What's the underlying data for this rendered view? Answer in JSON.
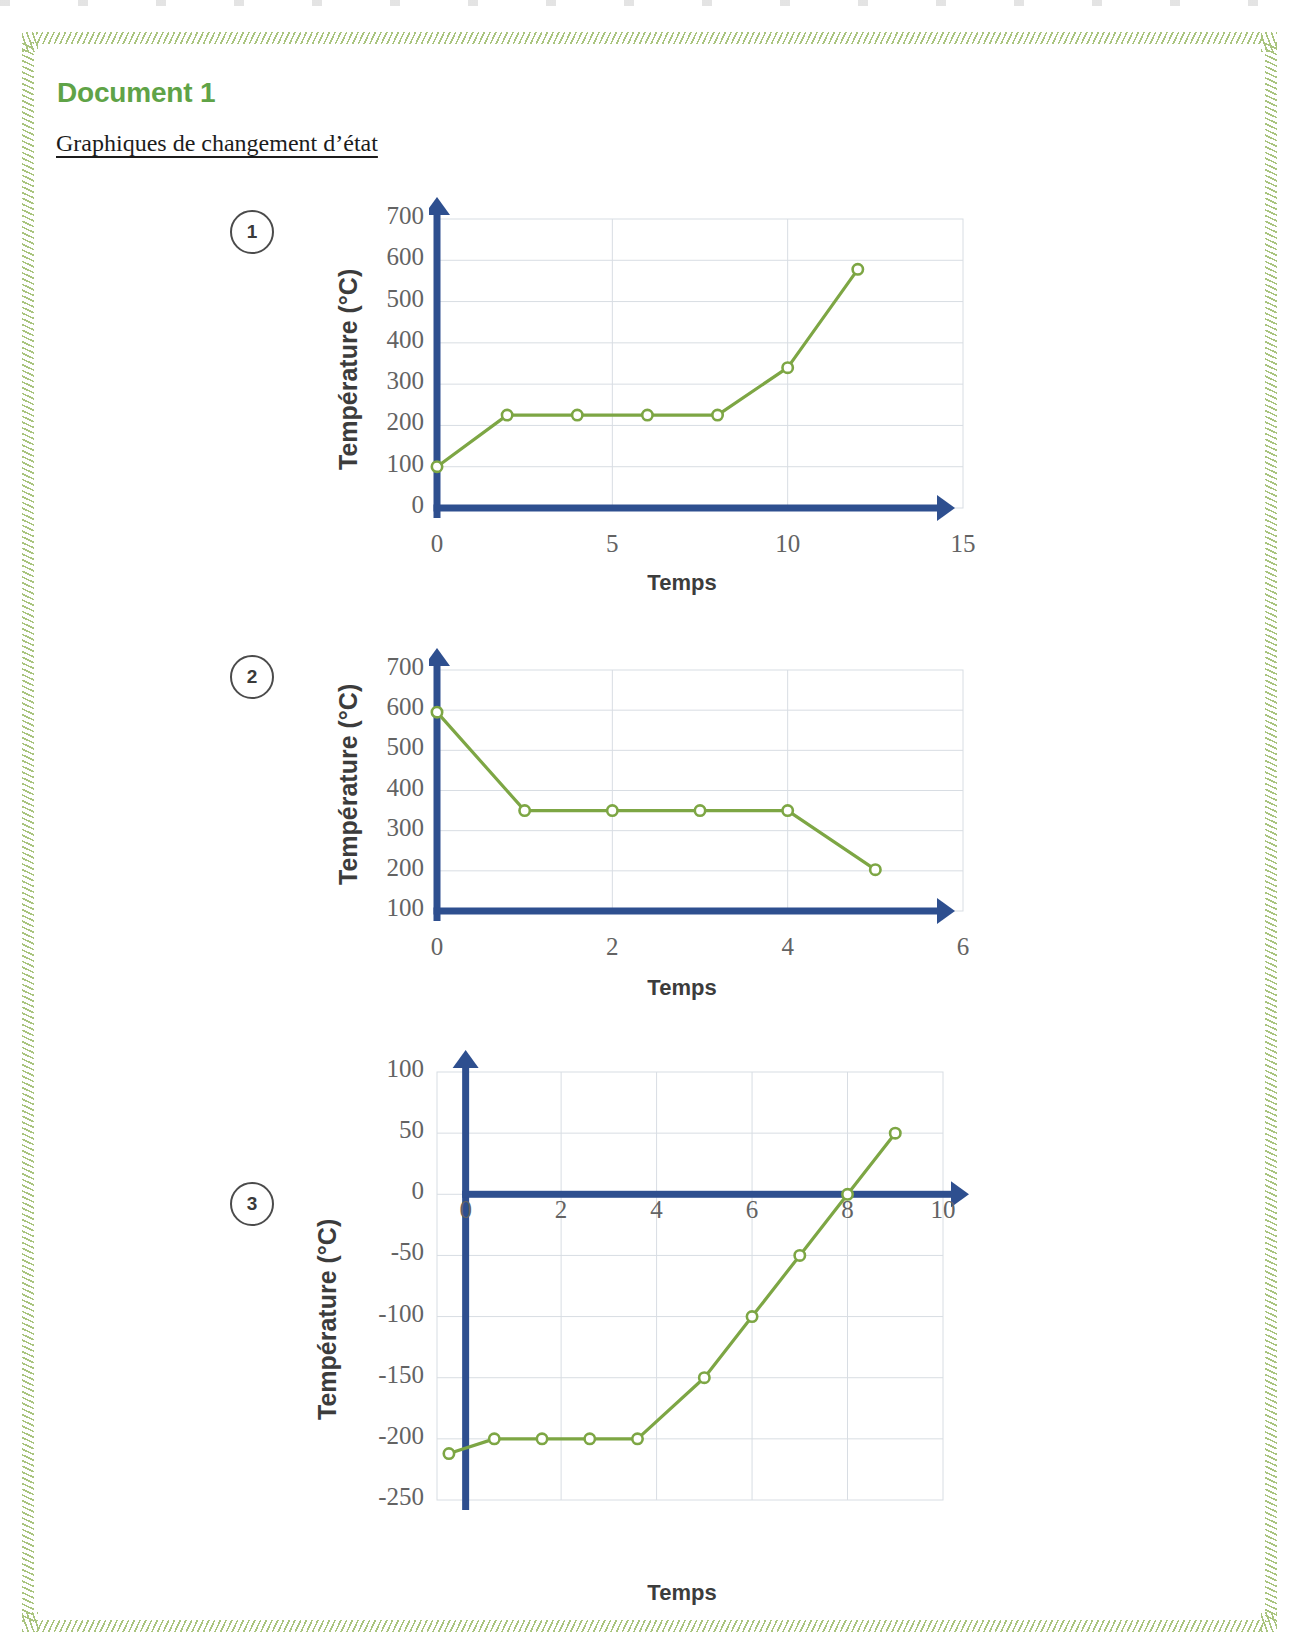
{
  "document": {
    "title": "Document 1",
    "subtitle": "Graphiques de changement d’état"
  },
  "colors": {
    "title_green": "#5fa347",
    "frame_green": "#a9c47e",
    "axis_blue": "#2e4f8f",
    "series_green": "#7da644",
    "grid": "#d8dde3",
    "tick_text": "#636363"
  },
  "charts": [
    {
      "badge": "1",
      "ylabel": "Température (°C)",
      "xlabel": "Temps",
      "chart_data": {
        "type": "line",
        "title": "",
        "xlabel": "Temps",
        "ylabel": "Température (°C)",
        "xlim": [
          0,
          15
        ],
        "ylim": [
          0,
          700
        ],
        "xticks": [
          "0",
          "5",
          "10",
          "15"
        ],
        "xtick_values": [
          0,
          5,
          10,
          15
        ],
        "yticks": [
          "0",
          "100",
          "200",
          "300",
          "400",
          "500",
          "600",
          "700"
        ],
        "ytick_values": [
          0,
          100,
          200,
          300,
          400,
          500,
          600,
          700
        ],
        "grid": true,
        "legend": "none",
        "series": [
          {
            "name": "Température",
            "x": [
              0,
              2,
              4,
              6,
              8,
              10,
              12
            ],
            "y": [
              100,
              225,
              225,
              225,
              225,
              340,
              578
            ],
            "marker": "open-circle"
          }
        ]
      }
    },
    {
      "badge": "2",
      "ylabel": "Température (°C)",
      "xlabel": "Temps",
      "chart_data": {
        "type": "line",
        "title": "",
        "xlabel": "Temps",
        "ylabel": "Température (°C)",
        "xlim": [
          0,
          6
        ],
        "ylim": [
          100,
          700
        ],
        "xticks": [
          "0",
          "2",
          "4",
          "6"
        ],
        "xtick_values": [
          0,
          2,
          4,
          6
        ],
        "yticks": [
          "100",
          "200",
          "300",
          "400",
          "500",
          "600",
          "700"
        ],
        "ytick_values": [
          100,
          200,
          300,
          400,
          500,
          600,
          700
        ],
        "grid": true,
        "legend": "none",
        "series": [
          {
            "name": "Température",
            "x": [
              0,
              1,
              2,
              3,
              4,
              5
            ],
            "y": [
              595,
              350,
              350,
              350,
              350,
              203
            ],
            "marker": "open-circle"
          }
        ]
      }
    },
    {
      "badge": "3",
      "ylabel": "Température (°C)",
      "xlabel": "Temps",
      "chart_data": {
        "type": "line",
        "title": "",
        "xlabel": "Temps",
        "ylabel": "Température (°C)",
        "xlim": [
          -0.6,
          10
        ],
        "ylim": [
          -250,
          100
        ],
        "xticks": [
          "0",
          "2",
          "4",
          "6",
          "8",
          "10"
        ],
        "xtick_values": [
          0,
          2,
          4,
          6,
          8,
          10
        ],
        "yticks": [
          "100",
          "50",
          "0",
          "-50",
          "-100",
          "-150",
          "-200",
          "-250"
        ],
        "ytick_values": [
          100,
          50,
          0,
          -50,
          -100,
          -150,
          -200,
          -250
        ],
        "grid": true,
        "legend": "none",
        "series": [
          {
            "name": "Température",
            "x": [
              -0.35,
              0.6,
              1.6,
              2.6,
              3.6,
              5,
              6,
              7,
              8,
              9
            ],
            "y": [
              -212,
              -200,
              -200,
              -200,
              -200,
              -150,
              -100,
              -50,
              0,
              50
            ],
            "marker": "open-circle"
          }
        ]
      }
    }
  ]
}
